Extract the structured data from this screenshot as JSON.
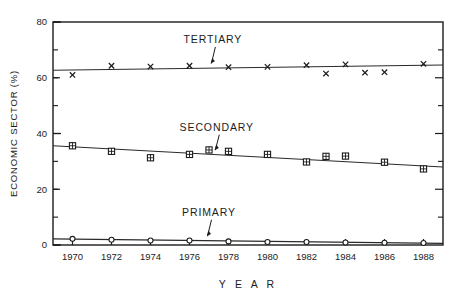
{
  "chart_data": {
    "type": "scatter",
    "title": "",
    "xlabel": "Y E A R",
    "ylabel": "ECONOMIC SECTOR (%)",
    "xlim": [
      1969,
      1989
    ],
    "ylim": [
      0,
      80
    ],
    "yticks": [
      0,
      20,
      40,
      60,
      80
    ],
    "ytick_labels": [
      "0",
      "20",
      "40",
      "60",
      "80"
    ],
    "yticks_minor": [
      10,
      30,
      50,
      70
    ],
    "x": [
      1970,
      1972,
      1974,
      1976,
      1977,
      1978,
      1980,
      1982,
      1983,
      1984,
      1986,
      1988
    ],
    "xticks": [
      1970,
      1972,
      1974,
      1976,
      1978,
      1980,
      1982,
      1984,
      1986,
      1988
    ],
    "xtick_labels": [
      "1970",
      "1972",
      "1974",
      "1976",
      "1978",
      "1980",
      "1982",
      "1984",
      "1986",
      "1988"
    ],
    "grid": false,
    "legend_position": "inline-annotations",
    "series": [
      {
        "name": "TERTIARY",
        "marker": "x",
        "label_x": 1977.2,
        "label_y": 72.5,
        "points": [
          {
            "x": 1970,
            "y": 61.0
          },
          {
            "x": 1972,
            "y": 64.3
          },
          {
            "x": 1974,
            "y": 64.0
          },
          {
            "x": 1976,
            "y": 64.3
          },
          {
            "x": 1978,
            "y": 63.8
          },
          {
            "x": 1980,
            "y": 63.9
          },
          {
            "x": 1982,
            "y": 64.5
          },
          {
            "x": 1983,
            "y": 61.5
          },
          {
            "x": 1984,
            "y": 64.8
          },
          {
            "x": 1985,
            "y": 61.8
          },
          {
            "x": 1986,
            "y": 62.0
          },
          {
            "x": 1988,
            "y": 65.0
          }
        ],
        "trend": {
          "x1": 1969,
          "y1": 62.7,
          "x2": 1989,
          "y2": 64.6
        }
      },
      {
        "name": "SECONDARY",
        "marker": "box-cross",
        "label_x": 1977.4,
        "label_y": 41.0,
        "points": [
          {
            "x": 1970,
            "y": 35.6
          },
          {
            "x": 1972,
            "y": 33.6
          },
          {
            "x": 1974,
            "y": 31.3
          },
          {
            "x": 1976,
            "y": 32.5
          },
          {
            "x": 1977,
            "y": 34.1
          },
          {
            "x": 1978,
            "y": 33.6
          },
          {
            "x": 1980,
            "y": 32.5
          },
          {
            "x": 1982,
            "y": 29.8
          },
          {
            "x": 1983,
            "y": 31.8
          },
          {
            "x": 1984,
            "y": 31.9
          },
          {
            "x": 1986,
            "y": 29.7
          },
          {
            "x": 1988,
            "y": 27.3
          }
        ],
        "trend": {
          "x1": 1969,
          "y1": 35.6,
          "x2": 1989,
          "y2": 28.0
        }
      },
      {
        "name": "PRIMARY",
        "marker": "circle",
        "label_x": 1977.0,
        "label_y": 10.5,
        "points": [
          {
            "x": 1970,
            "y": 2.2
          },
          {
            "x": 1972,
            "y": 1.9
          },
          {
            "x": 1974,
            "y": 1.6
          },
          {
            "x": 1976,
            "y": 1.6
          },
          {
            "x": 1978,
            "y": 1.3
          },
          {
            "x": 1980,
            "y": 1.1
          },
          {
            "x": 1982,
            "y": 1.1
          },
          {
            "x": 1984,
            "y": 0.9
          },
          {
            "x": 1986,
            "y": 0.8
          },
          {
            "x": 1988,
            "y": 0.7
          }
        ],
        "trend": {
          "x1": 1969,
          "y1": 2.2,
          "x2": 1989,
          "y2": 0.6
        }
      }
    ]
  },
  "axes": {
    "y_title": "ECONOMIC  SECTOR  (%)",
    "x_title": "Y E A R"
  },
  "labels": {
    "tertiary": "TERTIARY",
    "secondary": "SECONDARY",
    "primary": "PRIMARY"
  }
}
